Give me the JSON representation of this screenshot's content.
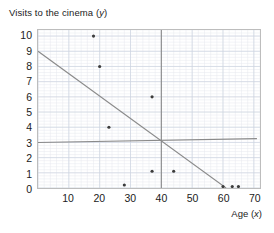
{
  "title": {
    "prefix": "Visits to the cinema (",
    "variable": "y",
    "suffix": ")"
  },
  "axes": {
    "x_name_prefix": "Age (",
    "x_name_variable": "x",
    "x_name_suffix": ")",
    "y_ticks": [
      "0",
      "1",
      "2",
      "3",
      "4",
      "5",
      "6",
      "7",
      "8",
      "9",
      "10"
    ],
    "x_ticks": [
      "10",
      "20",
      "30",
      "40",
      "50",
      "60",
      "70"
    ]
  },
  "colors": {
    "point": "#3c3c3c",
    "line": "#8a8a8a",
    "grid_minor": "#e6e9ef",
    "grid_major": "#cdd4e0",
    "border": "#bdbdbd",
    "text": "#1b1b1b"
  },
  "chart_data": {
    "type": "scatter",
    "title": "Visits to the cinema (y)",
    "xlabel": "Age (x)",
    "ylabel": "Visits to the cinema (y)",
    "xlim": [
      0,
      72
    ],
    "ylim": [
      0,
      10.4
    ],
    "grid": true,
    "legend": "none",
    "x_ticks": [
      10,
      20,
      30,
      40,
      50,
      60,
      70
    ],
    "y_ticks": [
      0,
      1,
      2,
      3,
      4,
      5,
      6,
      7,
      8,
      9,
      10
    ],
    "points": [
      {
        "x": 18,
        "y": 10
      },
      {
        "x": 20,
        "y": 8
      },
      {
        "x": 23,
        "y": 4
      },
      {
        "x": 28,
        "y": 0.2
      },
      {
        "x": 37,
        "y": 6
      },
      {
        "x": 37,
        "y": 1.1
      },
      {
        "x": 44,
        "y": 1.1
      },
      {
        "x": 60,
        "y": 0.1
      },
      {
        "x": 63,
        "y": 0.1
      },
      {
        "x": 65,
        "y": 0.1
      }
    ],
    "lines": [
      {
        "name": "fitted-line",
        "x0": 0,
        "y0": 9,
        "x1": 61,
        "y1": 0
      },
      {
        "name": "mean-y-line",
        "x0": 0,
        "y0": 3,
        "x1": 71,
        "y1": 3.25
      },
      {
        "name": "mean-x-line",
        "x0": 40,
        "y0": 0,
        "x1": 40,
        "y1": 10.4
      }
    ]
  }
}
